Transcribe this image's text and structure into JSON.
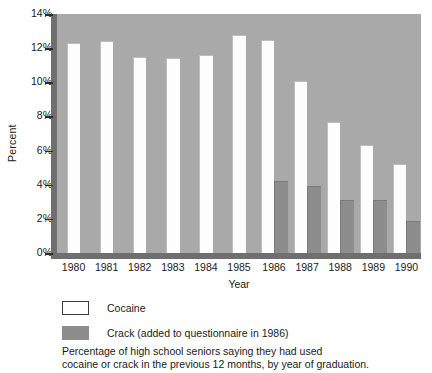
{
  "chart_data": {
    "type": "bar",
    "title": "",
    "xlabel": "Year",
    "ylabel": "Percent",
    "categories": [
      "1980",
      "1981",
      "1982",
      "1983",
      "1984",
      "1985",
      "1986",
      "1987",
      "1988",
      "1989",
      "1990"
    ],
    "series": [
      {
        "name": "Cocaine",
        "color": "#ffffff",
        "values": [
          12.3,
          12.4,
          11.5,
          11.4,
          11.6,
          12.8,
          12.5,
          10.1,
          7.7,
          6.3,
          5.2
        ]
      },
      {
        "name": "Crack (added to questionnaire in 1986)",
        "color": "#8d8d8d",
        "values": [
          null,
          null,
          null,
          null,
          null,
          null,
          4.2,
          3.9,
          3.1,
          3.1,
          1.9
        ]
      }
    ],
    "ylim": [
      0,
      14
    ],
    "yticks": [
      0,
      2,
      4,
      6,
      8,
      10,
      12,
      14
    ],
    "ytick_labels": [
      "0%",
      "2%",
      "4%",
      "6%",
      "8%",
      "10%",
      "12%",
      "14%"
    ],
    "grid": false,
    "legend_position": "below-axes",
    "plot_background": "#a9a9a9",
    "annotations": [
      "Percentage of high school seniors saying they had used",
      "cocaine or crack in the previous 12 months, by year of graduation."
    ]
  },
  "axes": {
    "ylabel": "Percent",
    "xlabel": "Year"
  },
  "legend": {
    "items": [
      {
        "label": "Cocaine",
        "swatch": "cocaine"
      },
      {
        "label": "Crack (added to questionnaire in 1986)",
        "swatch": "crack"
      }
    ]
  },
  "caption": {
    "line1": "Percentage of high school seniors saying they had used",
    "line2": "cocaine or crack in the previous 12 months, by year of graduation."
  }
}
